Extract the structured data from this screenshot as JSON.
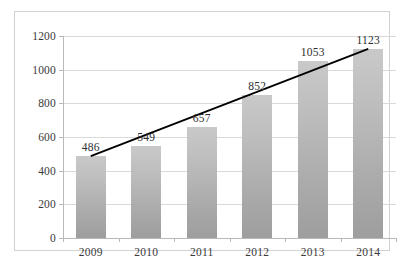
{
  "chart_data": {
    "type": "bar",
    "title": "",
    "subtitle": "",
    "xlabel": "",
    "ylabel": "",
    "categories": [
      "2009",
      "2010",
      "2011",
      "2012",
      "2013",
      "2014"
    ],
    "values": [
      486,
      549,
      657,
      852,
      1053,
      1123
    ],
    "data_labels": [
      "486",
      "549",
      "657",
      "852",
      "1053",
      "1123"
    ],
    "ylim": [
      0,
      1200
    ],
    "yticks": [
      0,
      200,
      400,
      600,
      800,
      1000,
      1200
    ],
    "ytick_labels": [
      "0",
      "200",
      "400",
      "600",
      "800",
      "1000",
      "1200"
    ],
    "grid": true,
    "grid_axis": "y",
    "legend": false,
    "legend_position": "none",
    "series": [
      {
        "name": "",
        "type": "bar",
        "values": [
          486,
          549,
          657,
          852,
          1053,
          1123
        ],
        "color": "#b5b5b5"
      },
      {
        "name": "",
        "type": "line",
        "annotation": "linear trend line",
        "color": "#000000",
        "start": {
          "x": "2009",
          "y": 486
        },
        "end": {
          "x": "2014",
          "y": 1123
        }
      }
    ],
    "colors": {
      "bar_top": "#c9c9c9",
      "bar_bottom": "#9e9e9e",
      "trendline": "#000000",
      "gridline": "#d9d9d9",
      "axis": "#b9b9b9",
      "frame": "#d2d2d2",
      "text": "#3a3a3a",
      "background": "#ffffff"
    }
  }
}
